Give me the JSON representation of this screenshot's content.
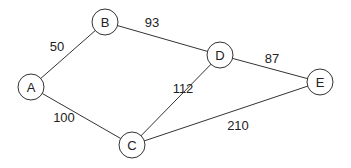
{
  "graph": {
    "nodes": [
      {
        "id": "A",
        "label": "A",
        "x": 31,
        "y": 87
      },
      {
        "id": "B",
        "label": "B",
        "x": 105,
        "y": 22
      },
      {
        "id": "C",
        "label": "C",
        "x": 132,
        "y": 145
      },
      {
        "id": "D",
        "label": "D",
        "x": 220,
        "y": 55
      },
      {
        "id": "E",
        "label": "E",
        "x": 320,
        "y": 82
      }
    ],
    "edges": [
      {
        "from": "A",
        "to": "B",
        "weight": "50",
        "lx": 57,
        "ly": 46
      },
      {
        "from": "B",
        "to": "D",
        "weight": "93",
        "lx": 152,
        "ly": 22
      },
      {
        "from": "D",
        "to": "E",
        "weight": "87",
        "lx": 272,
        "ly": 58
      },
      {
        "from": "A",
        "to": "C",
        "weight": "100",
        "lx": 64,
        "ly": 117
      },
      {
        "from": "C",
        "to": "D",
        "weight": "112",
        "lx": 183,
        "ly": 88
      },
      {
        "from": "C",
        "to": "E",
        "weight": "210",
        "lx": 238,
        "ly": 125
      }
    ],
    "node_radius": 13,
    "colors": {
      "stroke": "#333333",
      "text": "#222222",
      "background": "#ffffff"
    }
  }
}
